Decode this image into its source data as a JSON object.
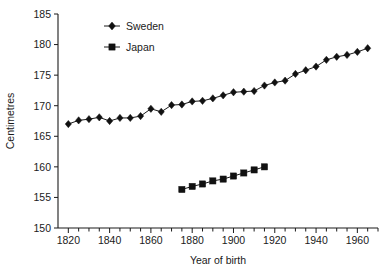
{
  "chart_data": {
    "type": "line",
    "title": "",
    "xlabel": "Year of birth",
    "ylabel": "Centimetres",
    "xlim": [
      1815,
      1970
    ],
    "ylim": [
      150,
      185
    ],
    "ytick_values": [
      150,
      155,
      160,
      165,
      170,
      175,
      180,
      185
    ],
    "ytick_labels": [
      "150",
      "155",
      "160",
      "165",
      "170",
      "175",
      "180",
      "185"
    ],
    "xtick_major_values": [
      1820,
      1840,
      1860,
      1880,
      1900,
      1920,
      1940,
      1960
    ],
    "xtick_major_labels": [
      "1820",
      "1840",
      "1860",
      "1880",
      "1900",
      "1920",
      "1940",
      "1960"
    ],
    "xtick_minor_step": 5,
    "grid": false,
    "legend_position": "top-center",
    "series": [
      {
        "name": "Sweden",
        "marker": "diamond",
        "color": "#111111",
        "points": [
          [
            1820,
            167.0
          ],
          [
            1825,
            167.6
          ],
          [
            1830,
            167.8
          ],
          [
            1835,
            168.1
          ],
          [
            1840,
            167.5
          ],
          [
            1845,
            168.0
          ],
          [
            1850,
            168.0
          ],
          [
            1855,
            168.3
          ],
          [
            1860,
            169.5
          ],
          [
            1865,
            169.0
          ],
          [
            1870,
            170.1
          ],
          [
            1875,
            170.2
          ],
          [
            1880,
            170.7
          ],
          [
            1885,
            170.8
          ],
          [
            1890,
            171.2
          ],
          [
            1895,
            171.7
          ],
          [
            1900,
            172.2
          ],
          [
            1905,
            172.3
          ],
          [
            1910,
            172.4
          ],
          [
            1915,
            173.3
          ],
          [
            1920,
            173.8
          ],
          [
            1925,
            174.1
          ],
          [
            1930,
            175.2
          ],
          [
            1935,
            175.8
          ],
          [
            1940,
            176.4
          ],
          [
            1945,
            177.5
          ],
          [
            1950,
            178.0
          ],
          [
            1955,
            178.3
          ],
          [
            1960,
            178.8
          ],
          [
            1965,
            179.4
          ]
        ]
      },
      {
        "name": "Japan",
        "marker": "square",
        "color": "#111111",
        "points": [
          [
            1875,
            156.3
          ],
          [
            1880,
            156.8
          ],
          [
            1885,
            157.2
          ],
          [
            1890,
            157.7
          ],
          [
            1895,
            158.0
          ],
          [
            1900,
            158.5
          ],
          [
            1905,
            159.0
          ],
          [
            1910,
            159.5
          ],
          [
            1915,
            160.0
          ]
        ]
      }
    ]
  },
  "legend": {
    "entries": [
      {
        "label": "Sweden",
        "marker": "diamond"
      },
      {
        "label": "Japan",
        "marker": "square"
      }
    ]
  }
}
